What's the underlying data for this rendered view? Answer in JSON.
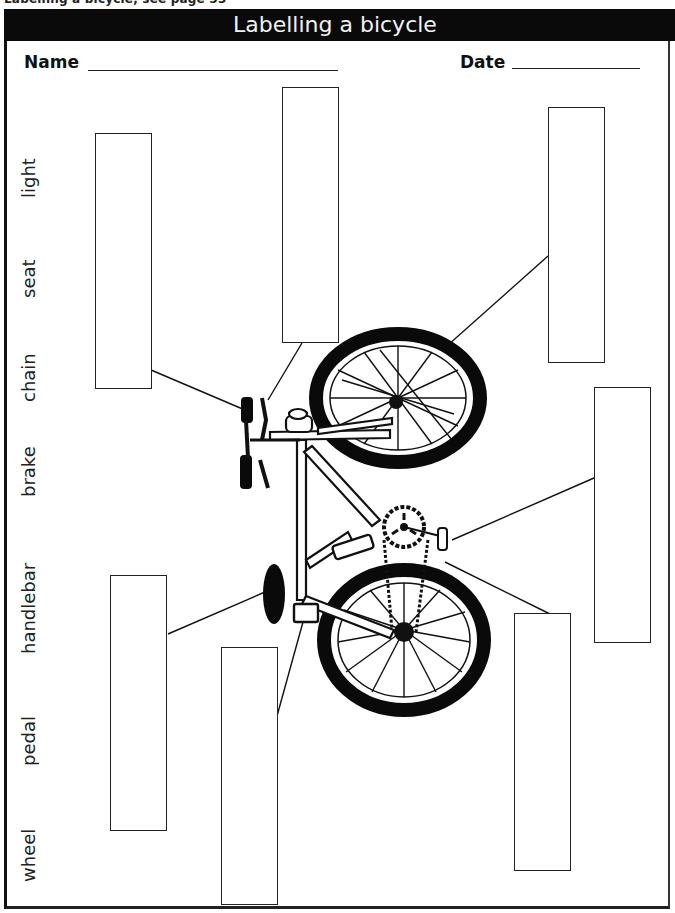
{
  "header": {
    "running_head": "Labelling a bicycle, see page 53",
    "title": "Labelling a bicycle"
  },
  "fields": {
    "name_label": "Name",
    "date_label": "Date"
  },
  "word_bank": [
    {
      "word": "light"
    },
    {
      "word": "seat"
    },
    {
      "word": "chain"
    },
    {
      "word": "brake"
    },
    {
      "word": "handlebar"
    },
    {
      "word": "pedal"
    },
    {
      "word": "wheel"
    }
  ],
  "label_boxes": [
    {
      "id": "box-1",
      "points_to": "handlebar grip",
      "value": ""
    },
    {
      "id": "box-2",
      "points_to": "brake lever",
      "value": ""
    },
    {
      "id": "box-3",
      "points_to": "front wheel",
      "value": ""
    },
    {
      "id": "box-4",
      "points_to": "pedal",
      "value": ""
    },
    {
      "id": "box-5",
      "points_to": "chain",
      "value": ""
    },
    {
      "id": "box-6",
      "points_to": "seat",
      "value": ""
    },
    {
      "id": "box-7",
      "points_to": "light",
      "value": ""
    }
  ],
  "colors": {
    "ink": "#111111",
    "title_bar": "#0a0a0a",
    "title_text": "#f2f2f2",
    "paper": "#ffffff"
  }
}
